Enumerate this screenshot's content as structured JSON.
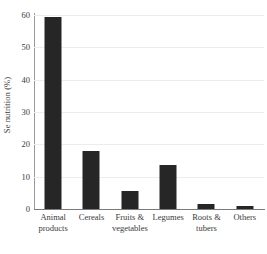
{
  "chart_data": {
    "type": "bar",
    "title": "",
    "xlabel": "",
    "ylabel": "Se nutrition (%)",
    "categories": [
      "Animal products",
      "Cereals",
      "Fruits & vegetables",
      "Legumes",
      "Roots & tubers",
      "Others"
    ],
    "category_lines": [
      [
        "Animal",
        "products"
      ],
      [
        "Cereals",
        ""
      ],
      [
        "Fruits &",
        "vegetables"
      ],
      [
        "Legumes",
        ""
      ],
      [
        "Roots &",
        "tubers"
      ],
      [
        "Others",
        ""
      ]
    ],
    "values": [
      59.5,
      18.0,
      5.6,
      13.5,
      1.5,
      0.9
    ],
    "ylim": [
      0,
      60
    ],
    "yticks": [
      0,
      10,
      20,
      30,
      40,
      50,
      60
    ],
    "ytick_labels": [
      "0",
      "10",
      "20",
      "30",
      "40",
      "50",
      "60"
    ],
    "grid": true,
    "legend": "none",
    "bar_color": "#262626",
    "grid_color": "#ededed",
    "axis_color": "#7a7a7a",
    "text_color": "#3a3a3a"
  }
}
